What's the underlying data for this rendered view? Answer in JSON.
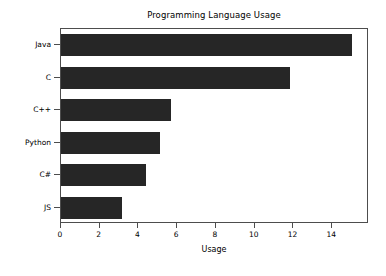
{
  "chart_data": {
    "type": "bar",
    "orientation": "horizontal",
    "title": "Programming Language Usage",
    "xlabel": "Usage",
    "ylabel": "",
    "categories": [
      "Java",
      "C",
      "C++",
      "Python",
      "C#",
      "JS"
    ],
    "values": [
      15.0,
      11.8,
      5.7,
      5.1,
      4.4,
      3.15
    ],
    "xlim": [
      0,
      15.9
    ],
    "xticks": [
      0,
      2,
      4,
      6,
      8,
      10,
      12,
      14
    ],
    "xtick_labels": [
      "0",
      "2",
      "4",
      "6",
      "8",
      "10",
      "12",
      "14"
    ],
    "grid": false,
    "legend": false,
    "bar_color": "#262626",
    "axes_color": "#4d4d4d",
    "background": "#ffffff"
  }
}
